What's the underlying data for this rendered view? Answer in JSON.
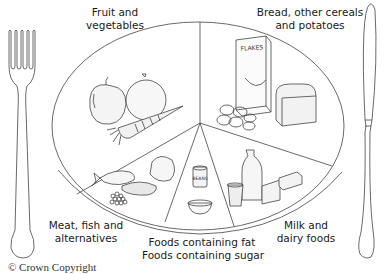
{
  "diagram": {
    "segments": [
      {
        "id": "fruit-veg",
        "label_line1": "Fruit and",
        "label_line2": "vegetables",
        "items": [
          "apple",
          "orange",
          "carrot"
        ]
      },
      {
        "id": "bread-cereals",
        "label_line1": "Bread, other cereals",
        "label_line2": "and potatoes",
        "items": [
          "cereal box",
          "loaf of bread",
          "potatoes"
        ],
        "box_text": "FLAKES"
      },
      {
        "id": "milk-dairy",
        "label_line1": "Milk and",
        "label_line2": "dairy foods",
        "items": [
          "milk bottle",
          "yogurt pot",
          "cheese",
          "butter"
        ]
      },
      {
        "id": "fat-sugar",
        "label_line1": "Foods containing fat",
        "label_line2": "Foods containing sugar",
        "items": [
          "baked beans tin",
          "bowl"
        ],
        "tin_text": "BEANS"
      },
      {
        "id": "meat-fish",
        "label_line1": "Meat, fish and",
        "label_line2": "alternatives",
        "items": [
          "fish",
          "meat",
          "chicken",
          "beans/peas"
        ]
      }
    ],
    "cutlery": {
      "left": "fork",
      "right": "knife"
    },
    "copyright": "© Crown Copyright"
  }
}
